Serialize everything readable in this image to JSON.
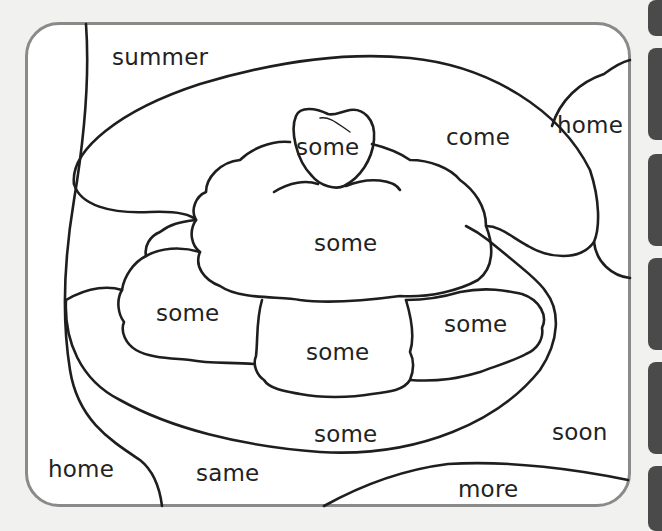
{
  "worksheet": {
    "type": "color-by-word",
    "subject": "ice cream sundae with cherry",
    "colors": {
      "frame": "#8a8a8a",
      "line": "#1e1e1e",
      "paper": "#ffffff",
      "background": "#f1f1f0"
    },
    "words": [
      {
        "id": "summer",
        "text": "summer",
        "x": 112,
        "y": 46
      },
      {
        "id": "cherry",
        "text": "some",
        "x": 296,
        "y": 136
      },
      {
        "id": "come",
        "text": "come",
        "x": 446,
        "y": 126
      },
      {
        "id": "home-right",
        "text": "home",
        "x": 557,
        "y": 114
      },
      {
        "id": "scoop-top",
        "text": "some",
        "x": 314,
        "y": 232
      },
      {
        "id": "scoop-left",
        "text": "some",
        "x": 156,
        "y": 302
      },
      {
        "id": "scoop-middle",
        "text": "some",
        "x": 306,
        "y": 341
      },
      {
        "id": "scoop-right",
        "text": "some",
        "x": 444,
        "y": 313
      },
      {
        "id": "bowl",
        "text": "some",
        "x": 314,
        "y": 423
      },
      {
        "id": "soon",
        "text": "soon",
        "x": 552,
        "y": 421
      },
      {
        "id": "home-left",
        "text": "home",
        "x": 48,
        "y": 458
      },
      {
        "id": "same",
        "text": "same",
        "x": 196,
        "y": 462
      },
      {
        "id": "more",
        "text": "more",
        "x": 458,
        "y": 478
      }
    ]
  }
}
